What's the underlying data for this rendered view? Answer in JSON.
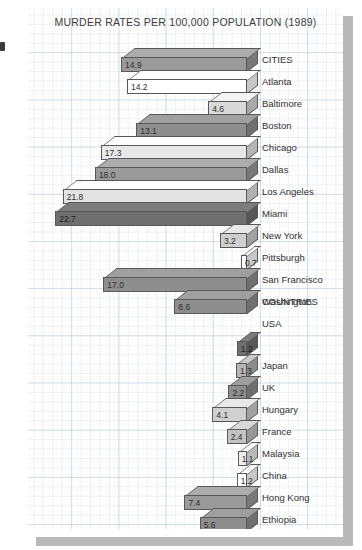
{
  "chart_data": {
    "type": "bar",
    "orientation": "horizontal",
    "title": "MURDER RATES PER 100,000 POPULATION (1989)",
    "xlabel": "",
    "ylabel": "",
    "xlim": [
      0,
      26
    ],
    "grid": true,
    "legend": null,
    "style": "3d-horizontal-bars-on-graph-paper",
    "value_unit": "murders per 100,000 population",
    "groups": [
      {
        "name": "CITIES",
        "categories": [
          "Atlanta",
          "Baltimore",
          "Boston",
          "Chicago",
          "Dallas",
          "Los Angeles",
          "Miami",
          "New York",
          "Pittsburgh",
          "San Francisco",
          "Washington"
        ],
        "values": [
          14.9,
          14.2,
          4.6,
          13.1,
          17.3,
          18.0,
          21.8,
          22.7,
          3.2,
          0.7,
          17.0
        ]
      },
      {
        "name": "COUNTRIES",
        "categories": [
          "USA",
          "Japan",
          "UK",
          "Hungary",
          "France",
          "Malaysia",
          "China",
          "Hong Kong",
          "Ethiopia",
          "Chile"
        ],
        "values": [
          8.6,
          1.2,
          1.3,
          2.2,
          4.1,
          2.4,
          1.1,
          1.2,
          7.4,
          5.6
        ]
      }
    ],
    "categories": [
      "Atlanta",
      "Baltimore",
      "Boston",
      "Chicago",
      "Dallas",
      "Los Angeles",
      "Miami",
      "New York",
      "Pittsburgh",
      "San Francisco",
      "Washington",
      "USA",
      "Japan",
      "UK",
      "Hungary",
      "France",
      "Malaysia",
      "China",
      "Hong Kong",
      "Ethiopia",
      "Chile"
    ],
    "values": [
      14.9,
      14.2,
      4.6,
      13.1,
      17.3,
      18.0,
      21.8,
      22.7,
      3.2,
      0.7,
      17.0,
      8.6,
      1.2,
      1.3,
      2.2,
      4.1,
      2.4,
      1.1,
      1.2,
      7.4,
      5.6
    ],
    "value_labels": [
      "14.9",
      "14.2",
      "4.6",
      "13.1",
      "17.3",
      "18.0",
      "21.8",
      "22.7",
      "3.2",
      "0.7",
      "17.0",
      "8.6",
      "1.2",
      "1.3",
      "2.2",
      "4.1",
      "2.4",
      "1.1",
      "1.2",
      "7.4",
      "5.6"
    ],
    "group_headers": [
      "CITIES",
      "COUNTRIES"
    ],
    "bar_colors": [
      "#9a9a9a",
      "#ffffff",
      "#d9d9d9",
      "#8e8e8e",
      "#e8e8e8",
      "#9a9a9a",
      "#e3e3e3",
      "#6f6f6f",
      "#cfcfcf",
      "#ffffff",
      "#8e8e8e",
      "#8e8e8e",
      "#6f6f6f",
      "#b4b4b4",
      "#8e8e8e",
      "#d0d0d0",
      "#c2c2c2",
      "#efefef",
      "#ffffff",
      "#9a9a9a",
      "#8e8e8e"
    ],
    "colors": {
      "grid": "#96aac3",
      "paper": "#fdfdfd",
      "shadow": "#b9b9b9",
      "text": "#333333",
      "bar_outline": "#585858"
    }
  }
}
